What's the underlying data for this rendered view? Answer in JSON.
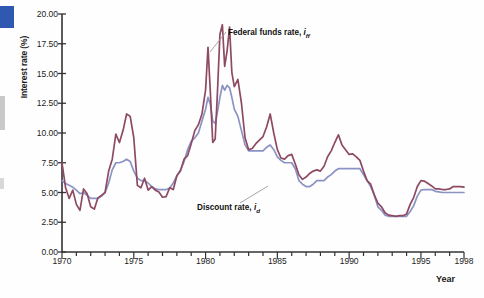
{
  "figure": {
    "title": "",
    "axis": {
      "y_label": "Interest rate (%)",
      "x_label": "Year"
    }
  },
  "series_labels": {
    "federal_funds": {
      "text": "Federal funds rate, ",
      "symbol": "i",
      "subscript": "ff"
    },
    "discount": {
      "text": "Discount rate, ",
      "symbol": "i",
      "subscript": "d"
    }
  },
  "colors": {
    "federal_funds": "#8e4a63",
    "discount": "#8b93c4",
    "axis": "#333333",
    "leader": "#9a9a9a",
    "page_block": "#2f58b0"
  },
  "chart_data": {
    "type": "line",
    "title": "",
    "xlabel": "Year",
    "ylabel": "Interest rate (%)",
    "xlim": [
      1970,
      1998
    ],
    "ylim": [
      0,
      20
    ],
    "ytick_labels": [
      "0.00",
      "2.50",
      "5.00",
      "7.50",
      "10.00",
      "12.50",
      "15.00",
      "17.50",
      "20.00"
    ],
    "yticks": [
      0,
      2.5,
      5,
      7.5,
      10,
      12.5,
      15,
      17.5,
      20
    ],
    "xticks": [
      1970,
      1971,
      1972,
      1973,
      1974,
      1975,
      1976,
      1977,
      1978,
      1979,
      1980,
      1981,
      1982,
      1983,
      1984,
      1985,
      1986,
      1987,
      1988,
      1989,
      1990,
      1991,
      1992,
      1993,
      1994,
      1995,
      1996,
      1997,
      1998
    ],
    "xtick_labels": [
      {
        "x": 1970,
        "label": "1970"
      },
      {
        "x": 1975,
        "label": "1975"
      },
      {
        "x": 1980,
        "label": "1980"
      },
      {
        "x": 1985,
        "label": "1985"
      },
      {
        "x": 1990,
        "label": "1990"
      },
      {
        "x": 1995,
        "label": "1995"
      },
      {
        "x": 1998,
        "label": "1998"
      }
    ],
    "grid": false,
    "legend": "inline-annotations",
    "series": [
      {
        "name": "Federal funds rate, i_ff",
        "color": "#8e4a63",
        "x": [
          1970.0,
          1970.25,
          1970.5,
          1970.75,
          1971.0,
          1971.25,
          1971.5,
          1971.75,
          1972.0,
          1972.25,
          1972.5,
          1972.75,
          1973.0,
          1973.25,
          1973.5,
          1973.75,
          1974.0,
          1974.25,
          1974.5,
          1974.75,
          1975.0,
          1975.25,
          1975.5,
          1975.75,
          1976.0,
          1976.25,
          1976.5,
          1976.75,
          1977.0,
          1977.25,
          1977.5,
          1977.75,
          1978.0,
          1978.25,
          1978.5,
          1978.75,
          1979.0,
          1979.25,
          1979.5,
          1979.75,
          1980.0,
          1980.17,
          1980.33,
          1980.5,
          1980.67,
          1980.83,
          1981.0,
          1981.17,
          1981.33,
          1981.5,
          1981.67,
          1981.83,
          1982.0,
          1982.25,
          1982.5,
          1982.75,
          1983.0,
          1983.25,
          1983.5,
          1983.75,
          1984.0,
          1984.25,
          1984.5,
          1984.75,
          1985.0,
          1985.25,
          1985.5,
          1985.75,
          1986.0,
          1986.25,
          1986.5,
          1986.75,
          1987.0,
          1987.25,
          1987.5,
          1987.75,
          1988.0,
          1988.25,
          1988.5,
          1988.75,
          1989.0,
          1989.25,
          1989.5,
          1989.75,
          1990.0,
          1990.25,
          1990.5,
          1990.75,
          1991.0,
          1991.25,
          1991.5,
          1991.75,
          1992.0,
          1992.25,
          1992.5,
          1992.75,
          1993.0,
          1993.25,
          1993.5,
          1993.75,
          1994.0,
          1994.25,
          1994.5,
          1994.75,
          1995.0,
          1995.25,
          1995.5,
          1995.75,
          1996.0,
          1996.25,
          1996.5,
          1996.75,
          1997.0,
          1997.25,
          1997.5,
          1997.75,
          1998.0
        ],
        "y": [
          7.5,
          5.4,
          4.5,
          5.2,
          4.0,
          3.5,
          5.3,
          4.9,
          3.8,
          3.6,
          4.55,
          4.75,
          5.0,
          6.8,
          7.8,
          9.9,
          9.2,
          10.2,
          11.6,
          11.4,
          9.6,
          5.6,
          5.4,
          6.2,
          5.2,
          5.5,
          5.2,
          5.05,
          4.6,
          4.65,
          5.4,
          5.25,
          6.4,
          6.8,
          7.8,
          8.1,
          9.1,
          10.2,
          10.7,
          11.6,
          13.6,
          17.2,
          13.5,
          9.2,
          9.5,
          13.5,
          18.3,
          19.1,
          15.6,
          16.9,
          18.9,
          15.1,
          13.9,
          14.5,
          12.5,
          9.6,
          8.6,
          8.7,
          9.1,
          9.4,
          9.7,
          10.5,
          11.6,
          10.0,
          8.6,
          7.9,
          7.8,
          8.1,
          8.2,
          7.4,
          6.5,
          6.1,
          6.3,
          6.6,
          6.8,
          6.9,
          6.8,
          7.2,
          8.0,
          8.5,
          9.2,
          9.85,
          9.0,
          8.6,
          8.2,
          8.25,
          8.0,
          7.7,
          6.8,
          6.0,
          5.7,
          4.8,
          4.1,
          3.8,
          3.3,
          3.1,
          3.05,
          3.0,
          3.05,
          3.05,
          3.2,
          4.0,
          4.6,
          5.5,
          6.0,
          5.95,
          5.75,
          5.55,
          5.3,
          5.3,
          5.25,
          5.25,
          5.3,
          5.5,
          5.5,
          5.5,
          5.45
        ]
      },
      {
        "name": "Discount rate, i_d",
        "color": "#8b93c4",
        "x": [
          1970.0,
          1970.25,
          1970.5,
          1970.75,
          1971.0,
          1971.25,
          1971.5,
          1971.75,
          1972.0,
          1972.25,
          1972.5,
          1972.75,
          1973.0,
          1973.25,
          1973.5,
          1973.75,
          1974.0,
          1974.25,
          1974.5,
          1974.75,
          1975.0,
          1975.25,
          1975.5,
          1975.75,
          1976.0,
          1976.25,
          1976.5,
          1976.75,
          1977.0,
          1977.25,
          1977.5,
          1977.75,
          1978.0,
          1978.25,
          1978.5,
          1978.75,
          1979.0,
          1979.25,
          1979.5,
          1979.75,
          1980.0,
          1980.17,
          1980.33,
          1980.5,
          1980.67,
          1980.83,
          1981.0,
          1981.17,
          1981.33,
          1981.5,
          1981.67,
          1981.83,
          1982.0,
          1982.25,
          1982.5,
          1982.75,
          1983.0,
          1983.25,
          1983.5,
          1983.75,
          1984.0,
          1984.25,
          1984.5,
          1984.75,
          1985.0,
          1985.25,
          1985.5,
          1985.75,
          1986.0,
          1986.25,
          1986.5,
          1986.75,
          1987.0,
          1987.25,
          1987.5,
          1987.75,
          1988.0,
          1988.25,
          1988.5,
          1988.75,
          1989.0,
          1989.25,
          1989.5,
          1989.75,
          1990.0,
          1990.25,
          1990.5,
          1990.75,
          1991.0,
          1991.25,
          1991.5,
          1991.75,
          1992.0,
          1992.25,
          1992.5,
          1992.75,
          1993.0,
          1993.25,
          1993.5,
          1993.75,
          1994.0,
          1994.25,
          1994.5,
          1994.75,
          1995.0,
          1995.25,
          1995.5,
          1995.75,
          1996.0,
          1996.25,
          1996.5,
          1996.75,
          1997.0,
          1997.25,
          1997.5,
          1997.75,
          1998.0
        ],
        "y": [
          6.0,
          5.75,
          5.6,
          5.45,
          5.2,
          4.9,
          5.0,
          4.75,
          4.5,
          4.5,
          4.5,
          4.7,
          5.0,
          5.8,
          6.9,
          7.5,
          7.5,
          7.6,
          7.8,
          7.6,
          6.8,
          6.2,
          6.0,
          6.0,
          5.8,
          5.5,
          5.3,
          5.25,
          5.25,
          5.25,
          5.35,
          5.8,
          6.4,
          6.9,
          7.6,
          8.6,
          9.3,
          9.6,
          10.0,
          11.0,
          12.0,
          13.0,
          12.4,
          11.0,
          10.8,
          11.8,
          13.0,
          14.0,
          13.6,
          14.0,
          13.8,
          13.0,
          12.0,
          11.4,
          10.2,
          9.0,
          8.5,
          8.5,
          8.5,
          8.5,
          8.5,
          8.8,
          9.0,
          8.6,
          8.0,
          7.7,
          7.5,
          7.5,
          7.5,
          7.0,
          6.0,
          5.7,
          5.5,
          5.5,
          5.7,
          6.0,
          6.0,
          6.0,
          6.3,
          6.5,
          6.8,
          7.0,
          7.0,
          7.0,
          7.0,
          7.0,
          7.0,
          7.0,
          6.5,
          6.0,
          5.5,
          4.8,
          3.8,
          3.5,
          3.1,
          3.0,
          3.0,
          3.0,
          3.0,
          3.0,
          3.0,
          3.4,
          3.9,
          4.7,
          5.2,
          5.25,
          5.25,
          5.25,
          5.1,
          5.05,
          5.0,
          5.0,
          5.0,
          5.0,
          5.0,
          5.0,
          5.0
        ]
      }
    ]
  }
}
